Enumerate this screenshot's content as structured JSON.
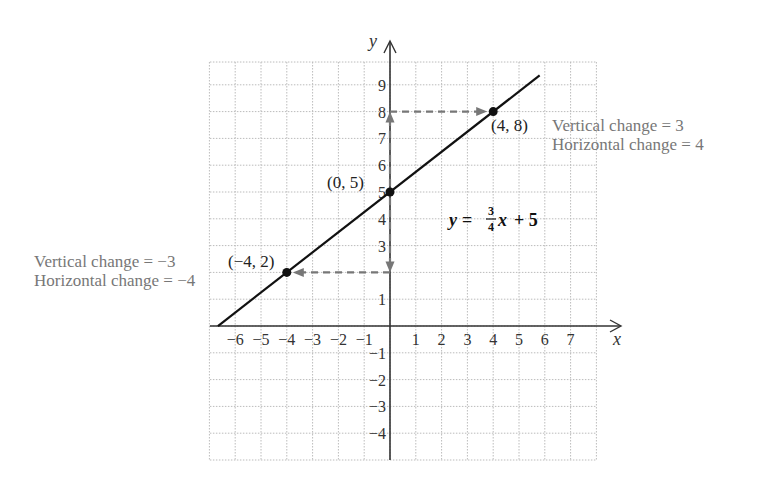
{
  "chart_data": {
    "type": "line",
    "title": "",
    "equation": {
      "lhs": "y",
      "equals": "=",
      "numerator": "3",
      "denominator": "4",
      "var": "x",
      "rest": "+ 5",
      "text": "y = (3/4)x + 5"
    },
    "xlabel": "x",
    "ylabel": "y",
    "xlim": [
      -7,
      8
    ],
    "ylim": [
      -5,
      10
    ],
    "grid": true,
    "x_ticks": [
      "-6",
      "-5",
      "-4",
      "-3",
      "-2",
      "-1",
      "1",
      "2",
      "3",
      "4",
      "5",
      "6",
      "7"
    ],
    "y_ticks": [
      "9",
      "8",
      "7",
      "6",
      "5",
      "4",
      "3",
      "1",
      "-1",
      "-2",
      "-3",
      "-4"
    ],
    "series": [
      {
        "name": "y = 3/4 x + 5",
        "slope": 0.75,
        "intercept": 5,
        "x": [
          -6.67,
          5.8
        ],
        "y": [
          0,
          9.35
        ]
      }
    ],
    "points": [
      {
        "label": "(0, 5)",
        "x": 0,
        "y": 5
      },
      {
        "label": "(4, 8)",
        "x": 4,
        "y": 8
      },
      {
        "label": "(−4, 2)",
        "x": -4,
        "y": 2
      }
    ],
    "annotations": [
      {
        "text": "Vertical change = 3",
        "near": "(4, 8)"
      },
      {
        "text": "Horizontal change = 4",
        "near": "(4, 8)"
      },
      {
        "text": "Vertical change = −3",
        "near": "(-4, 2)"
      },
      {
        "text": "Horizontal change = −4",
        "near": "(-4, 2)"
      }
    ],
    "dashed_arrows": [
      {
        "from": [
          0,
          5
        ],
        "to": [
          0,
          8
        ],
        "meaning": "vertical change +3"
      },
      {
        "from": [
          0,
          8
        ],
        "to": [
          4,
          8
        ],
        "meaning": "horizontal change +4"
      },
      {
        "from": [
          0,
          5
        ],
        "to": [
          0,
          2
        ],
        "meaning": "vertical change -3"
      },
      {
        "from": [
          0,
          2
        ],
        "to": [
          -4,
          2
        ],
        "meaning": "horizontal change -4"
      }
    ]
  },
  "labels": {
    "x_axis": "x",
    "y_axis": "y",
    "point_a": "(0, 5)",
    "point_b": "(4, 8)",
    "point_c": "(−4, 2)",
    "right_vertical": "Vertical change = 3",
    "right_horizontal": "Horizontal change = 4",
    "left_vertical": "Vertical change = −3",
    "left_horizontal": "Horizontal change = −4",
    "eq_lhs": "y =",
    "eq_num": "3",
    "eq_den": "4",
    "eq_var": "x",
    "eq_rest": "+ 5"
  },
  "ticks": {
    "x": [
      {
        "v": -6,
        "t": "−6"
      },
      {
        "v": -5,
        "t": "−5"
      },
      {
        "v": -4,
        "t": "−4"
      },
      {
        "v": -3,
        "t": "−3"
      },
      {
        "v": -2,
        "t": "−2"
      },
      {
        "v": -1,
        "t": "−1"
      },
      {
        "v": 1,
        "t": "1"
      },
      {
        "v": 2,
        "t": "2"
      },
      {
        "v": 3,
        "t": "3"
      },
      {
        "v": 4,
        "t": "4"
      },
      {
        "v": 5,
        "t": "5"
      },
      {
        "v": 6,
        "t": "6"
      },
      {
        "v": 7,
        "t": "7"
      }
    ],
    "y": [
      {
        "v": 9,
        "t": "9"
      },
      {
        "v": 8,
        "t": "8"
      },
      {
        "v": 7,
        "t": "7"
      },
      {
        "v": 6,
        "t": "6"
      },
      {
        "v": 5,
        "t": "5"
      },
      {
        "v": 4,
        "t": "4"
      },
      {
        "v": 3,
        "t": "3"
      },
      {
        "v": 1,
        "t": "1"
      },
      {
        "v": -1,
        "t": "−1"
      },
      {
        "v": -2,
        "t": "−2"
      },
      {
        "v": -3,
        "t": "−3"
      },
      {
        "v": -4,
        "t": "−4"
      }
    ]
  },
  "colors": {
    "line": "#111111",
    "axis": "#333333",
    "grid": "#bbbbbb",
    "dashed": "#777777",
    "note_text": "#777777"
  }
}
